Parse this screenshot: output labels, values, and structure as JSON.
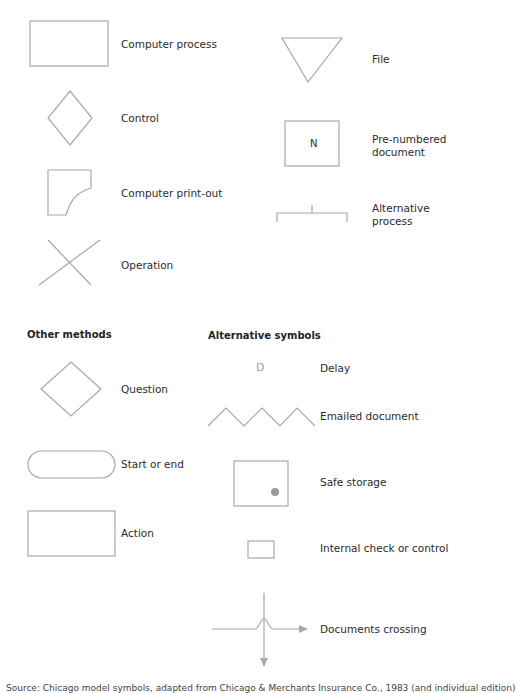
{
  "symbols": {
    "computer_process": "Computer process",
    "control": "Control",
    "computer_printout": "Computer print-out",
    "operation": "Operation",
    "file": "File",
    "pre_numbered_doc": "Pre-numbered document",
    "pre_numbered_mark": "N",
    "alternative_process": "Alternative process"
  },
  "other_methods": {
    "heading": "Other methods",
    "question": "Question",
    "start_or_end": "Start or end",
    "action": "Action"
  },
  "alternative_symbols": {
    "heading": "Alternative symbols",
    "delay_mark": "D",
    "delay": "Delay",
    "emailed_document": "Emailed document",
    "safe_storage": "Safe storage",
    "internal_check": "Internal check or control",
    "documents_crossing": "Documents crossing"
  },
  "caption": "Source: Chicago model symbols, adapted from Chicago & Merchants Insurance Co., 1983 (and individual edition)"
}
